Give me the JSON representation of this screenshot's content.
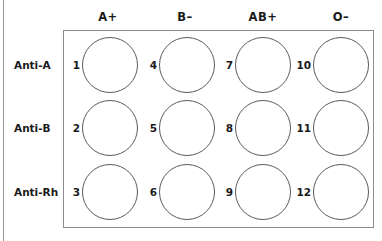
{
  "diagram": {
    "columns": [
      {
        "label": "A+",
        "x": 108
      },
      {
        "label": "B–",
        "x": 185
      },
      {
        "label": "AB+",
        "x": 263
      },
      {
        "label": "O–",
        "x": 341
      }
    ],
    "rows": [
      {
        "label": "Anti-A",
        "y": 65
      },
      {
        "label": "Anti-B",
        "y": 128
      },
      {
        "label": "Anti-Rh",
        "y": 192
      }
    ],
    "wells": [
      {
        "number": "1",
        "col": 0,
        "row": 0
      },
      {
        "number": "2",
        "col": 0,
        "row": 1
      },
      {
        "number": "3",
        "col": 0,
        "row": 2
      },
      {
        "number": "4",
        "col": 1,
        "row": 0
      },
      {
        "number": "5",
        "col": 1,
        "row": 1
      },
      {
        "number": "6",
        "col": 1,
        "row": 2
      },
      {
        "number": "7",
        "col": 2,
        "row": 0
      },
      {
        "number": "8",
        "col": 2,
        "row": 1
      },
      {
        "number": "9",
        "col": 2,
        "row": 2
      },
      {
        "number": "10",
        "col": 3,
        "row": 0
      },
      {
        "number": "11",
        "col": 3,
        "row": 1
      },
      {
        "number": "12",
        "col": 3,
        "row": 2
      }
    ]
  }
}
